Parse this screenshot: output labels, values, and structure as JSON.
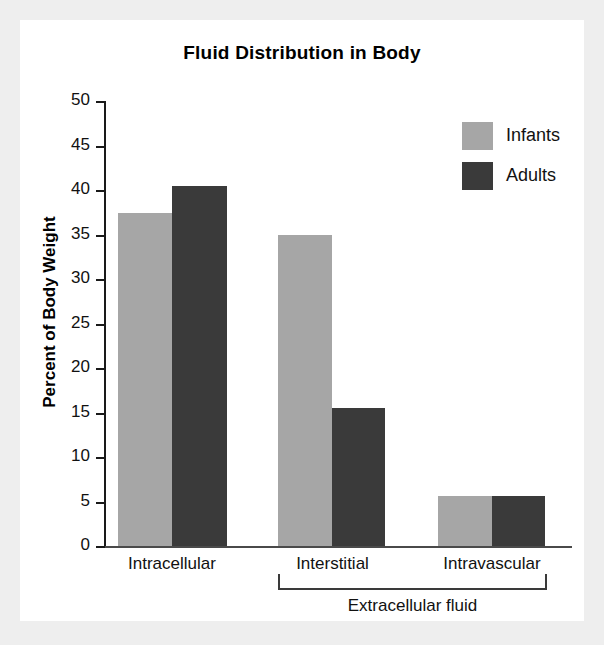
{
  "chart_data": {
    "type": "bar",
    "title": "Fluid Distribution in Body",
    "xlabel": "",
    "ylabel": "Percent of Body Weight",
    "ylim": [
      0,
      50
    ],
    "ytick_step": 5,
    "yticks": [
      50,
      45,
      40,
      35,
      30,
      25,
      20,
      15,
      10,
      5,
      0
    ],
    "grid": false,
    "legend_position": "top-right",
    "categories": [
      "Intracellular",
      "Interstitial",
      "Intravascular"
    ],
    "series": [
      {
        "name": "Infants",
        "color": "#a6a6a6",
        "values": [
          37.4,
          35.0,
          5.6
        ]
      },
      {
        "name": "Adults",
        "color": "#3a3a3a",
        "values": [
          40.4,
          15.5,
          5.6
        ]
      }
    ],
    "annotations": [
      {
        "text": "Extracellular fluid",
        "type": "group-bracket",
        "covers": [
          "Interstitial",
          "Intravascular"
        ]
      }
    ]
  },
  "axis": {
    "tick_labels": [
      "50",
      "45",
      "40",
      "35",
      "30",
      "25",
      "20",
      "15",
      "10",
      "5",
      "0"
    ],
    "y_title": "Percent of Body Weight"
  },
  "legend": {
    "items": [
      {
        "label": "Infants",
        "swatch": "light-gray-swatch"
      },
      {
        "label": "Adults",
        "swatch": "dark-gray-swatch"
      }
    ]
  },
  "bracket": {
    "label": "Extracellular fluid"
  },
  "colors": {
    "infants": "#a6a6a6",
    "adults": "#3a3a3a",
    "axis": "#1a1a1a",
    "panel_background": "#ffffff",
    "page_background": "#eeeeee"
  }
}
